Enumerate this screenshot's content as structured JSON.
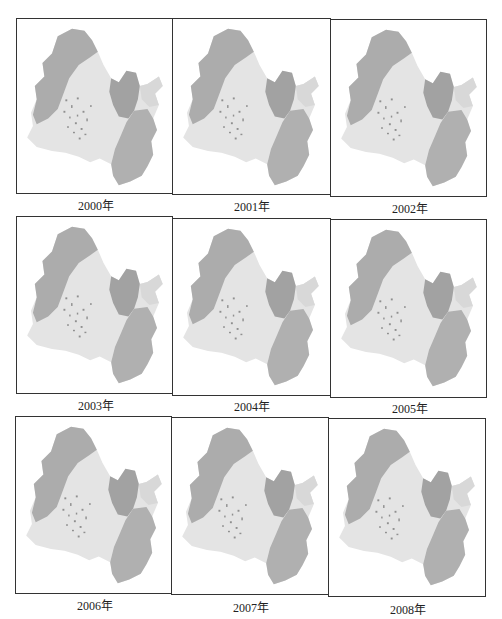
{
  "figure": {
    "panels": [
      {
        "year_label": "2000年"
      },
      {
        "year_label": "2001年"
      },
      {
        "year_label": "2002年"
      },
      {
        "year_label": "2003年"
      },
      {
        "year_label": "2004年"
      },
      {
        "year_label": "2005年"
      },
      {
        "year_label": "2006年"
      },
      {
        "year_label": "2007年"
      },
      {
        "year_label": "2008年"
      }
    ],
    "colors": {
      "dark_region": "#a9a9a9",
      "mid_region": "#c4c4c4",
      "light_region": "#e4e4e4",
      "speckle": "#8a8a8a",
      "frame": "#333333"
    }
  }
}
